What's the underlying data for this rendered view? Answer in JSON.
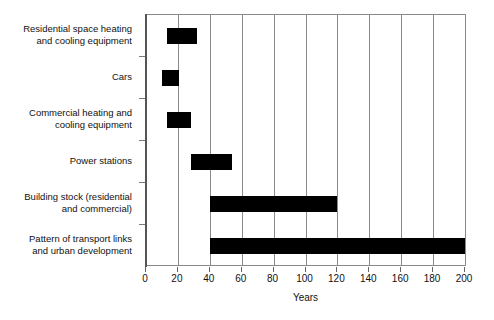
{
  "chart_data": {
    "type": "bar",
    "orientation": "horizontal",
    "subtype": "range-bar",
    "title": "",
    "xlabel": "Years",
    "ylabel": "",
    "xlim": [
      0,
      200
    ],
    "ylim": null,
    "grid": true,
    "gridlines_x": [
      20,
      40,
      60,
      80,
      100,
      120,
      140,
      160,
      180,
      200
    ],
    "xticks": [
      0,
      20,
      40,
      60,
      80,
      100,
      120,
      140,
      160,
      180,
      200
    ],
    "xtick_labels": [
      "0",
      "20",
      "40",
      "60",
      "80",
      "100",
      "120",
      "140",
      "160",
      "180",
      "200"
    ],
    "legend": null,
    "bar_color": "#000000",
    "categories": [
      "Residential space heating and cooling equipment",
      "Cars",
      "Commercial heating and cooling equipment",
      "Power stations",
      "Building stock (residential and commercial)",
      "Pattern of transport links and urban development"
    ],
    "ranges": [
      {
        "label": "Residential space heating and cooling equipment",
        "start": 13,
        "end": 32
      },
      {
        "label": "Cars",
        "start": 10,
        "end": 21
      },
      {
        "label": "Commercial heating and cooling equipment",
        "start": 13,
        "end": 28
      },
      {
        "label": "Power stations",
        "start": 28,
        "end": 54
      },
      {
        "label": "Building stock (residential and commercial)",
        "start": 40,
        "end": 120
      },
      {
        "label": "Pattern of transport links and urban development",
        "start": 40,
        "end": 200
      }
    ]
  },
  "labels": {
    "cat_0_line_1": "Residential space heating",
    "cat_0_line_2": "and cooling equipment",
    "cat_1_line_1": "Cars",
    "cat_2_line_1": "Commercial heating and",
    "cat_2_line_2": "cooling equipment",
    "cat_3_line_1": "Power stations",
    "cat_4_line_1": "Building stock (residential",
    "cat_4_line_2": "and commercial)",
    "cat_5_line_1": "Pattern of transport links",
    "cat_5_line_2": "and urban development",
    "x_axis_title": "Years"
  }
}
